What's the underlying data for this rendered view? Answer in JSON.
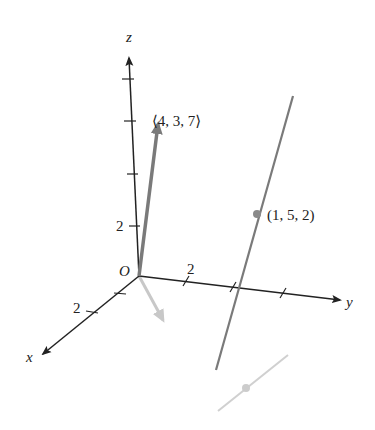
{
  "figure": {
    "type": "3d-coordinate-diagram",
    "axes": {
      "x": {
        "label": "x",
        "tick_label": "2"
      },
      "y": {
        "label": "y",
        "tick_label": "2"
      },
      "z": {
        "label": "z",
        "tick_label": "2"
      },
      "origin_label": "O"
    },
    "vector": {
      "label": "⟨4, 3, 7⟩",
      "components": [
        4,
        3,
        7
      ]
    },
    "point": {
      "label": "(1, 5, 2)",
      "coords": [
        1,
        5,
        2
      ]
    },
    "colors": {
      "axes": "#222222",
      "vector": "#7a7a7a",
      "line": "#7a7a7a",
      "projection": "#c8c8c8",
      "point": "#8a8a8a"
    }
  }
}
